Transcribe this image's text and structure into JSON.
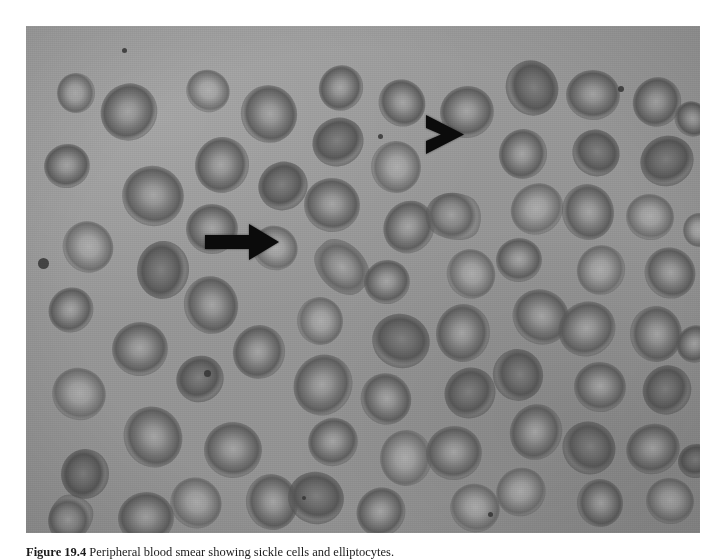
{
  "figure": {
    "caption_label": "Figure 19.4",
    "caption_text": " Peripheral blood smear showing sickle cells and elliptocytes.",
    "alt": "Light micrograph of a peripheral blood smear: numerous red blood cells with central pallor on a gray background, with two black annotation markers",
    "background_color": "#ffffff"
  },
  "micrograph": {
    "name": "peripheral-blood-smear",
    "modality": "light-microscopy",
    "stain": "Wright-Giemsa",
    "color_mode": "grayscale",
    "background_color": "#9b9b9b",
    "cell_color": "#707070",
    "cell_pale_color": "#b5b5b5",
    "width_px": 674,
    "height_px": 507,
    "origin_x_px": 26,
    "origin_y_px": 26
  },
  "annotations": [
    {
      "name": "arrow-marker",
      "icon": "right-arrow-icon",
      "shape": "solid-arrow-with-shaft",
      "color": "#0b0b0b",
      "x_px": 205,
      "y_px": 224,
      "width_px": 74,
      "height_px": 36,
      "points_to": "sickle cell"
    },
    {
      "name": "chevron-marker",
      "icon": "chevron-right-icon",
      "shape": "solid-arrowhead",
      "color": "#0b0b0b",
      "x_px": 426,
      "y_px": 115,
      "width_px": 38,
      "height_px": 39,
      "points_to": "elliptocyte"
    }
  ],
  "cells": [
    {
      "x": 30,
      "y": 48,
      "w": 40,
      "h": 38,
      "type": "pale"
    },
    {
      "x": 74,
      "y": 58,
      "w": 58,
      "h": 56,
      "type": "normal"
    },
    {
      "x": 18,
      "y": 118,
      "w": 46,
      "h": 44,
      "type": "normal"
    },
    {
      "x": 96,
      "y": 140,
      "w": 62,
      "h": 60,
      "type": "normal"
    },
    {
      "x": 36,
      "y": 196,
      "w": 52,
      "h": 50,
      "type": "pale"
    },
    {
      "x": 108,
      "y": 218,
      "w": 58,
      "h": 52,
      "type": "dense"
    },
    {
      "x": 22,
      "y": 262,
      "w": 46,
      "h": 44,
      "type": "normal"
    },
    {
      "x": 86,
      "y": 296,
      "w": 56,
      "h": 54,
      "type": "normal"
    },
    {
      "x": 26,
      "y": 342,
      "w": 54,
      "h": 52,
      "type": "pale"
    },
    {
      "x": 96,
      "y": 382,
      "w": 62,
      "h": 58,
      "type": "normal"
    },
    {
      "x": 34,
      "y": 424,
      "w": 50,
      "h": 48,
      "type": "dense"
    },
    {
      "x": 20,
      "y": 470,
      "w": 48,
      "h": 44,
      "type": "sickle"
    },
    {
      "x": 92,
      "y": 466,
      "w": 56,
      "h": 52,
      "type": "normal"
    },
    {
      "x": 160,
      "y": 44,
      "w": 44,
      "h": 42,
      "type": "pale"
    },
    {
      "x": 214,
      "y": 60,
      "w": 58,
      "h": 56,
      "type": "normal"
    },
    {
      "x": 168,
      "y": 112,
      "w": 56,
      "h": 54,
      "type": "normal"
    },
    {
      "x": 232,
      "y": 136,
      "w": 50,
      "h": 48,
      "type": "dense"
    },
    {
      "x": 160,
      "y": 178,
      "w": 52,
      "h": 50,
      "type": "normal"
    },
    {
      "x": 226,
      "y": 200,
      "w": 46,
      "h": 44,
      "type": "pale"
    },
    {
      "x": 156,
      "y": 252,
      "w": 58,
      "h": 54,
      "type": "normal"
    },
    {
      "x": 206,
      "y": 300,
      "w": 54,
      "h": 52,
      "type": "normal"
    },
    {
      "x": 150,
      "y": 330,
      "w": 48,
      "h": 46,
      "type": "dense"
    },
    {
      "x": 178,
      "y": 396,
      "w": 58,
      "h": 56,
      "type": "normal"
    },
    {
      "x": 144,
      "y": 452,
      "w": 52,
      "h": 50,
      "type": "pale"
    },
    {
      "x": 218,
      "y": 450,
      "w": 56,
      "h": 52,
      "type": "normal"
    },
    {
      "x": 292,
      "y": 40,
      "w": 46,
      "h": 44,
      "type": "normal"
    },
    {
      "x": 286,
      "y": 92,
      "w": 52,
      "h": 48,
      "type": "dense"
    },
    {
      "x": 278,
      "y": 152,
      "w": 56,
      "h": 54,
      "type": "normal"
    },
    {
      "x": 286,
      "y": 218,
      "w": 60,
      "h": 46,
      "type": "ellipto"
    },
    {
      "x": 270,
      "y": 272,
      "w": 48,
      "h": 46,
      "type": "pale"
    },
    {
      "x": 266,
      "y": 330,
      "w": 62,
      "h": 58,
      "type": "normal"
    },
    {
      "x": 282,
      "y": 392,
      "w": 50,
      "h": 48,
      "type": "normal"
    },
    {
      "x": 262,
      "y": 446,
      "w": 56,
      "h": 52,
      "type": "dense"
    },
    {
      "x": 352,
      "y": 54,
      "w": 48,
      "h": 46,
      "type": "normal"
    },
    {
      "x": 344,
      "y": 116,
      "w": 52,
      "h": 50,
      "type": "pale"
    },
    {
      "x": 356,
      "y": 176,
      "w": 54,
      "h": 50,
      "type": "normal"
    },
    {
      "x": 338,
      "y": 234,
      "w": 46,
      "h": 44,
      "type": "normal"
    },
    {
      "x": 346,
      "y": 288,
      "w": 58,
      "h": 54,
      "type": "dense"
    },
    {
      "x": 334,
      "y": 348,
      "w": 52,
      "h": 50,
      "type": "normal"
    },
    {
      "x": 352,
      "y": 406,
      "w": 56,
      "h": 52,
      "type": "pale"
    },
    {
      "x": 330,
      "y": 462,
      "w": 50,
      "h": 48,
      "type": "normal"
    },
    {
      "x": 414,
      "y": 60,
      "w": 54,
      "h": 52,
      "type": "normal"
    },
    {
      "x": 400,
      "y": 166,
      "w": 56,
      "h": 48,
      "type": "sickle"
    },
    {
      "x": 420,
      "y": 224,
      "w": 50,
      "h": 48,
      "type": "pale"
    },
    {
      "x": 408,
      "y": 280,
      "w": 58,
      "h": 54,
      "type": "normal"
    },
    {
      "x": 418,
      "y": 342,
      "w": 52,
      "h": 50,
      "type": "dense"
    },
    {
      "x": 400,
      "y": 400,
      "w": 56,
      "h": 54,
      "type": "normal"
    },
    {
      "x": 424,
      "y": 458,
      "w": 50,
      "h": 48,
      "type": "pale"
    },
    {
      "x": 478,
      "y": 36,
      "w": 56,
      "h": 52,
      "type": "dense"
    },
    {
      "x": 472,
      "y": 104,
      "w": 50,
      "h": 48,
      "type": "normal"
    },
    {
      "x": 484,
      "y": 158,
      "w": 54,
      "h": 50,
      "type": "pale"
    },
    {
      "x": 470,
      "y": 212,
      "w": 46,
      "h": 44,
      "type": "normal"
    },
    {
      "x": 486,
      "y": 264,
      "w": 58,
      "h": 54,
      "type": "normal"
    },
    {
      "x": 466,
      "y": 324,
      "w": 52,
      "h": 50,
      "type": "dense"
    },
    {
      "x": 482,
      "y": 380,
      "w": 56,
      "h": 52,
      "type": "normal"
    },
    {
      "x": 470,
      "y": 442,
      "w": 50,
      "h": 48,
      "type": "pale"
    },
    {
      "x": 540,
      "y": 44,
      "w": 54,
      "h": 50,
      "type": "normal"
    },
    {
      "x": 546,
      "y": 104,
      "w": 48,
      "h": 46,
      "type": "dense"
    },
    {
      "x": 534,
      "y": 160,
      "w": 56,
      "h": 52,
      "type": "normal"
    },
    {
      "x": 550,
      "y": 220,
      "w": 50,
      "h": 48,
      "type": "pale"
    },
    {
      "x": 532,
      "y": 276,
      "w": 58,
      "h": 54,
      "type": "normal"
    },
    {
      "x": 548,
      "y": 336,
      "w": 52,
      "h": 50,
      "type": "normal"
    },
    {
      "x": 536,
      "y": 396,
      "w": 54,
      "h": 52,
      "type": "dense"
    },
    {
      "x": 550,
      "y": 454,
      "w": 48,
      "h": 46,
      "type": "normal"
    },
    {
      "x": 606,
      "y": 52,
      "w": 50,
      "h": 48,
      "type": "normal"
    },
    {
      "x": 614,
      "y": 110,
      "w": 54,
      "h": 50,
      "type": "dense"
    },
    {
      "x": 600,
      "y": 168,
      "w": 48,
      "h": 46,
      "type": "pale"
    },
    {
      "x": 618,
      "y": 222,
      "w": 52,
      "h": 50,
      "type": "normal"
    },
    {
      "x": 602,
      "y": 282,
      "w": 56,
      "h": 52,
      "type": "normal"
    },
    {
      "x": 616,
      "y": 340,
      "w": 50,
      "h": 48,
      "type": "dense"
    },
    {
      "x": 600,
      "y": 398,
      "w": 54,
      "h": 50,
      "type": "normal"
    },
    {
      "x": 620,
      "y": 452,
      "w": 48,
      "h": 46,
      "type": "pale"
    },
    {
      "x": 648,
      "y": 76,
      "w": 36,
      "h": 34,
      "type": "normal"
    },
    {
      "x": 656,
      "y": 188,
      "w": 34,
      "h": 32,
      "type": "pale"
    },
    {
      "x": 650,
      "y": 300,
      "w": 38,
      "h": 36,
      "type": "normal"
    },
    {
      "x": 652,
      "y": 418,
      "w": 36,
      "h": 34,
      "type": "dense"
    }
  ],
  "specks": [
    {
      "x": 12,
      "y": 232,
      "d": 11
    },
    {
      "x": 178,
      "y": 344,
      "d": 7
    },
    {
      "x": 96,
      "y": 22,
      "d": 5
    },
    {
      "x": 352,
      "y": 108,
      "d": 5
    },
    {
      "x": 592,
      "y": 60,
      "d": 6
    },
    {
      "x": 462,
      "y": 486,
      "d": 5
    },
    {
      "x": 276,
      "y": 470,
      "d": 4
    }
  ]
}
